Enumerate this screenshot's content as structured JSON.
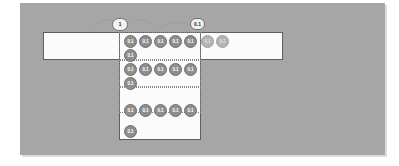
{
  "diagram": {
    "canvas_color": "#a6a6a6",
    "panel_color": "#fbfbfb",
    "chip_color": "#8e8e8e",
    "chip_faded_color": "#b3b3b3",
    "pins": [
      {
        "name": "pin-left",
        "label": "1",
        "x": 112,
        "y": 18
      },
      {
        "name": "pin-right",
        "label": "0.1",
        "x": 190,
        "y": 18
      }
    ],
    "rows": [
      {
        "name": "row-1",
        "y": 35,
        "chips": [
          {
            "label": "0.1",
            "x": 124,
            "faded": false
          },
          {
            "label": "0.1",
            "x": 139,
            "faded": false
          },
          {
            "label": "0.1",
            "x": 154,
            "faded": false
          },
          {
            "label": "0.1",
            "x": 169,
            "faded": false
          },
          {
            "label": "0.1",
            "x": 184,
            "faded": false
          },
          {
            "label": "0.1",
            "x": 201,
            "faded": true
          },
          {
            "label": "0.1",
            "x": 216,
            "faded": true
          }
        ]
      },
      {
        "name": "row-2",
        "y": 49,
        "chips": [
          {
            "label": "0.1",
            "x": 124,
            "faded": false
          }
        ]
      },
      {
        "name": "row-3",
        "y": 63,
        "chips": [
          {
            "label": "0.1",
            "x": 124,
            "faded": false
          },
          {
            "label": "0.1",
            "x": 139,
            "faded": false
          },
          {
            "label": "0.1",
            "x": 154,
            "faded": false
          },
          {
            "label": "0.1",
            "x": 169,
            "faded": false
          },
          {
            "label": "0.1",
            "x": 184,
            "faded": false
          }
        ]
      },
      {
        "name": "row-4",
        "y": 77,
        "chips": [
          {
            "label": "0.1",
            "x": 124,
            "faded": false
          }
        ]
      },
      {
        "name": "row-5",
        "y": 104,
        "chips": [
          {
            "label": "0.1",
            "x": 124,
            "faded": false
          },
          {
            "label": "0.1",
            "x": 139,
            "faded": false
          },
          {
            "label": "0.1",
            "x": 154,
            "faded": false
          },
          {
            "label": "0.1",
            "x": 169,
            "faded": false
          },
          {
            "label": "0.1",
            "x": 184,
            "faded": false
          }
        ]
      },
      {
        "name": "row-6",
        "y": 125,
        "chips": [
          {
            "label": "0.1",
            "x": 124,
            "faded": false
          }
        ]
      }
    ]
  }
}
